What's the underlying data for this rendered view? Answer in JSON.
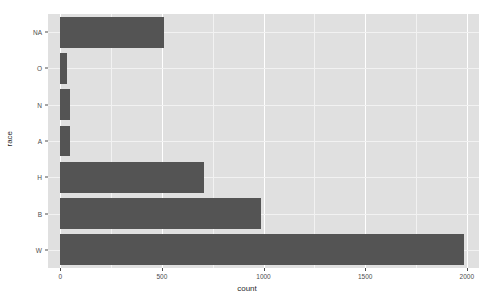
{
  "chart_data": {
    "type": "bar",
    "orientation": "horizontal",
    "title": "",
    "subtitle": "",
    "xlabel": "count",
    "ylabel": "race",
    "categories": [
      "W",
      "B",
      "H",
      "A",
      "N",
      "O",
      "NA"
    ],
    "values": [
      1986,
      990,
      706,
      50,
      49,
      35,
      510
    ],
    "series": [
      {
        "name": "count",
        "values": [
          1986,
          990,
          706,
          50,
          49,
          35,
          510
        ]
      }
    ],
    "category_order_top_to_bottom": [
      "NA",
      "O",
      "N",
      "A",
      "H",
      "B",
      "W"
    ],
    "xlim": [
      -60,
      2060
    ],
    "ylim": [
      0,
      7
    ],
    "xticks": [
      0,
      500,
      1000,
      1500,
      2000
    ],
    "xtick_labels": [
      "0",
      "500",
      "1000",
      "1500",
      "2000"
    ],
    "ytick_labels": [
      "NA",
      "O",
      "N",
      "A",
      "H",
      "B",
      "W"
    ],
    "grid": true,
    "grid_major_color": "#ffffff",
    "grid_minor_color": "#f2f2f2",
    "legend": false,
    "legend_position": "none",
    "panel_background": "#e0e0e0",
    "bar_color": "#545454",
    "plot_background": "#ffffff",
    "axis_text_color": "#4d4d4d",
    "axis_title_color": "#2b2b2b"
  },
  "axes": {
    "x_title": "count",
    "y_title": "race",
    "x_ticks": [
      {
        "label": "0",
        "value": 0
      },
      {
        "label": "500",
        "value": 500
      },
      {
        "label": "1000",
        "value": 1000
      },
      {
        "label": "1500",
        "value": 1500
      },
      {
        "label": "2000",
        "value": 2000
      }
    ],
    "y_ticks": [
      {
        "label": "NA",
        "value": 510
      },
      {
        "label": "O",
        "value": 35
      },
      {
        "label": "N",
        "value": 49
      },
      {
        "label": "A",
        "value": 50
      },
      {
        "label": "H",
        "value": 706
      },
      {
        "label": "B",
        "value": 990
      },
      {
        "label": "W",
        "value": 1986
      }
    ]
  }
}
